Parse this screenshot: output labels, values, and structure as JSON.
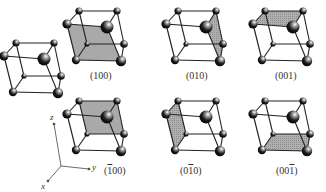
{
  "figure": {
    "colors": {
      "face": "#a9a9a9",
      "edge": "#222222",
      "atom": "#1a1a1a",
      "background": "#ffffff"
    },
    "reference_cube": {
      "label": ""
    },
    "planes": [
      {
        "id": "p100",
        "label_pre": "(",
        "label_bar": "",
        "label_mid": "100",
        "label_post": ")",
        "shaded_face": "front"
      },
      {
        "id": "p010",
        "label_pre": "(0",
        "label_bar": "",
        "label_mid": "10",
        "label_post": ")",
        "shaded_face": "right"
      },
      {
        "id": "p001",
        "label_pre": "(00",
        "label_bar": "",
        "label_mid": "1",
        "label_post": ")",
        "shaded_face": "top"
      },
      {
        "id": "pm100",
        "label_pre": "(",
        "label_bar": "1",
        "label_mid": "00",
        "label_post": ")",
        "shaded_face": "back"
      },
      {
        "id": "p0m10",
        "label_pre": "(0",
        "label_bar": "1",
        "label_mid": "0",
        "label_post": ")",
        "shaded_face": "left"
      },
      {
        "id": "p00m1",
        "label_pre": "(00",
        "label_bar": "1",
        "label_mid": "",
        "label_post": ")",
        "shaded_face": "bottom"
      }
    ],
    "axes": {
      "x": "x",
      "y": "y",
      "z": "z"
    }
  }
}
